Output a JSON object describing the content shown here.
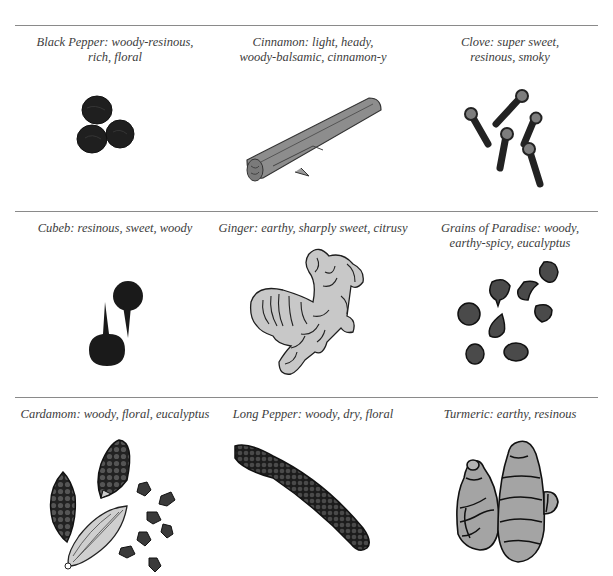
{
  "spices": [
    {
      "name": "Black Pepper",
      "caption": "Black Pepper: woody-resinous,\nrich, floral",
      "icon": "black-pepper-illustration"
    },
    {
      "name": "Cinnamon",
      "caption": "Cinnamon: light, heady,\nwoody-balsamic, cinnamon-y",
      "icon": "cinnamon-illustration"
    },
    {
      "name": "Clove",
      "caption": "Clove: super sweet,\nresinous, smoky",
      "icon": "clove-illustration"
    },
    {
      "name": "Cubeb",
      "caption": "Cubeb: resinous, sweet, woody",
      "icon": "cubeb-illustration"
    },
    {
      "name": "Ginger",
      "caption": "Ginger: earthy, sharply sweet, citrusy",
      "icon": "ginger-illustration"
    },
    {
      "name": "Grains of Paradise",
      "caption": "Grains of Paradise: woody,\nearthy-spicy, eucalyptus",
      "icon": "grains-of-paradise-illustration"
    },
    {
      "name": "Cardamom",
      "caption": "Cardamom: woody, floral, eucalyptus",
      "icon": "cardamom-illustration"
    },
    {
      "name": "Long Pepper",
      "caption": "Long Pepper: woody, dry, floral",
      "icon": "long-pepper-illustration"
    },
    {
      "name": "Turmeric",
      "caption": "Turmeric: earthy, resinous",
      "icon": "turmeric-illustration"
    }
  ],
  "colors": {
    "divider": "#8a8a8a",
    "ink_dark": "#1e1e1e",
    "fill_gray": "#bdbdbd",
    "fill_mid": "#9a9a9a",
    "text": "#3c3c3c"
  }
}
